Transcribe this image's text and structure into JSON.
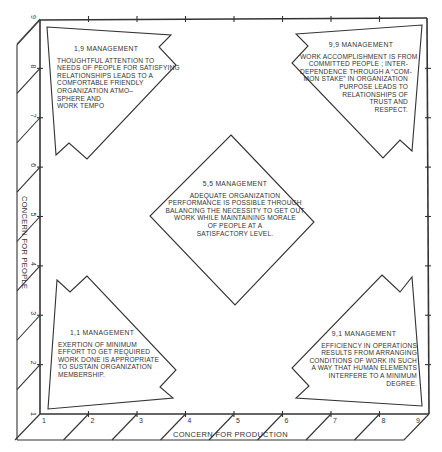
{
  "diagram": {
    "type": "managerial-grid",
    "x_axis": {
      "title": "CONCERN FOR PRODUCTION",
      "ticks": [
        "1",
        "2",
        "3",
        "4",
        "5",
        "6",
        "7",
        "8",
        "9"
      ]
    },
    "y_axis": {
      "title": "CONCERN FOR PEOPLE",
      "ticks": [
        "1",
        "2",
        "3",
        "4",
        "5",
        "6",
        "7",
        "8",
        "9"
      ]
    },
    "styles": [
      {
        "id": "1,9",
        "title": "1,9 MANAGEMENT",
        "lines": [
          "THOUGHTFUL ATTENTION TO",
          "NEEDS OF PEOPLE FOR SATISFYING",
          "RELATIONSHIPS LEADS TO A",
          "COMFORTABLE FRIENDLY",
          "ORGANIZATION ATMO–",
          "SPHERE AND",
          "WORK TEMPO"
        ]
      },
      {
        "id": "9,9",
        "title": "9,9 MANAGEMENT",
        "lines": [
          "WORK ACCOMPLISHMENT IS FROM",
          "COMMITTED PEOPLE ; INTER-",
          "DEPENDENCE THROUGH A “COM-",
          "MON STAKE” IN ORGANIZATION",
          "PURPOSE LEADS TO",
          "RELATIONSHIPS OF",
          "TRUST AND",
          "RESPECT."
        ]
      },
      {
        "id": "5,5",
        "title": "5,5 MANAGEMENT",
        "lines": [
          "ADEQUATE ORGANIZATION",
          "PERFORMANCE IS POSSIBLE THROUGH",
          "BALANCING THE NECESSITY TO GET OUT",
          "WORK WHILE MAINTAINING MORALE",
          "OF PEOPLE AT A",
          "SATISFACTORY LEVEL."
        ]
      },
      {
        "id": "1,1",
        "title": "1,1 MANAGEMENT",
        "lines": [
          "EXERTION OF MINIMUM",
          "EFFORT TO GET REQUIRED",
          "WORK DONE IS APPROPRIATE",
          "TO SUSTAIN ORGANIZATION",
          "MEMBERSHIP."
        ]
      },
      {
        "id": "9,1",
        "title": "9,1 MANAGEMENT",
        "lines": [
          "EFFICIENCY IN OPERATIONS",
          "RESULTS FROM ARRANGING",
          "CONDITIONS OF WORK IN SUCH",
          "A WAY THAT HUMAN ELEMENTS",
          "INTERFERE TO A MINIMUM",
          "DEGREE."
        ]
      }
    ]
  }
}
